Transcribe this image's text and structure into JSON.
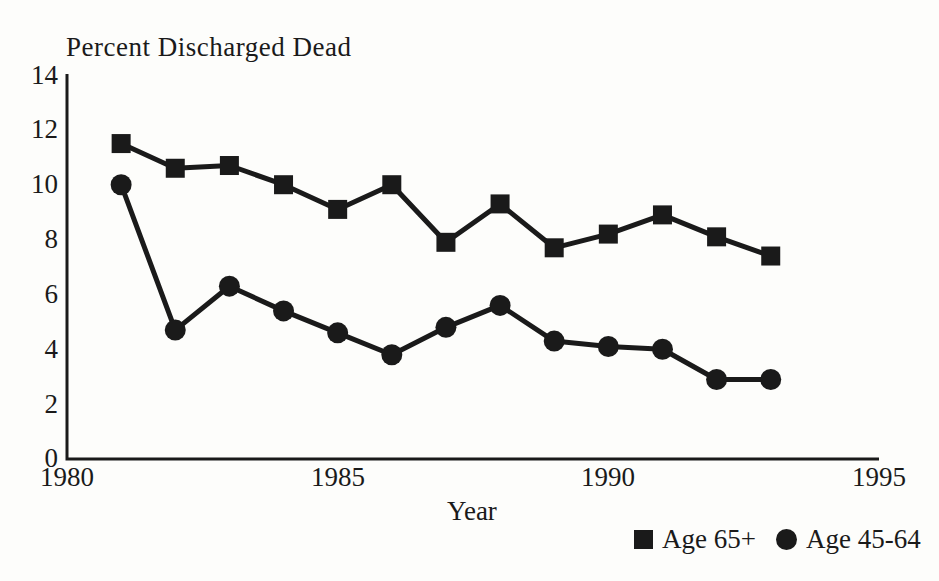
{
  "page": {
    "background": "#fdfdfb",
    "ink_color": "#1a1a1a"
  },
  "chart_data": {
    "type": "line",
    "title": "Percent Discharged Dead",
    "xlabel": "Year",
    "ylabel": "",
    "x": [
      1981,
      1982,
      1983,
      1984,
      1985,
      1986,
      1987,
      1988,
      1989,
      1990,
      1991,
      1992,
      1993
    ],
    "series": [
      {
        "name": "Age 65+",
        "marker": "square",
        "values": [
          11.5,
          10.6,
          10.7,
          10.0,
          9.1,
          10.0,
          7.9,
          9.3,
          7.7,
          8.2,
          8.9,
          8.1,
          7.4
        ]
      },
      {
        "name": "Age 45-64",
        "marker": "circle",
        "values": [
          10.0,
          4.7,
          6.3,
          5.4,
          4.6,
          3.8,
          4.8,
          5.6,
          4.3,
          4.1,
          4.0,
          2.9,
          2.9
        ]
      }
    ],
    "xlim": [
      1980,
      1995
    ],
    "ylim": [
      0,
      14
    ],
    "xticks": [
      1980,
      1985,
      1990,
      1995
    ],
    "yticks": [
      0,
      2,
      4,
      6,
      8,
      10,
      12,
      14
    ],
    "grid": false,
    "legend_position": "bottom-right",
    "line_color": "#1a1a1a"
  }
}
